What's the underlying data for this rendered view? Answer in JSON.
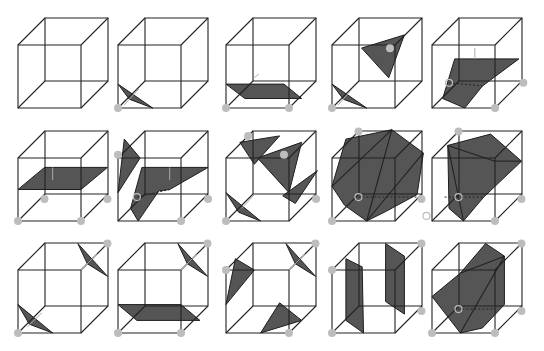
{
  "colors": {
    "edge": "#222222",
    "surface": "#555555",
    "vertex": "#bdbdbd",
    "normal": "#aaaaaa",
    "background": "#ffffff"
  },
  "layout": {
    "dx": 27,
    "dy": -27,
    "size": 63
  },
  "cubes": [
    {
      "id": 0,
      "x": 18,
      "y": 45,
      "vertices": [],
      "tris": []
    },
    {
      "id": 1,
      "x": 118,
      "y": 45,
      "vertices": [
        [
          0,
          1
        ]
      ],
      "tris": [
        [
          [
            0,
            0.62
          ],
          [
            0.55,
            1
          ],
          [
            0.18,
            0.86
          ]
        ]
      ],
      "arrows": [
        [
          [
            0.1,
            0.95
          ],
          [
            0.33,
            0.7
          ]
        ]
      ]
    },
    {
      "id": 2,
      "x": 226,
      "y": 45,
      "vertices": [
        [
          0,
          1
        ],
        [
          1,
          1
        ]
      ],
      "tris": [
        [
          [
            0,
            0.62
          ],
          [
            0.92,
            0.62
          ],
          [
            1.2,
            0.85
          ],
          [
            0.3,
            0.85
          ]
        ]
      ],
      "arrows": [
        [
          [
            0.45,
            0.52
          ],
          [
            0.52,
            0.46
          ]
        ]
      ]
    },
    {
      "id": 3,
      "x": 332,
      "y": 45,
      "vertices": [
        [
          0,
          1
        ],
        [
          0.92,
          0.05
        ]
      ],
      "tris": [
        [
          [
            0,
            0.62
          ],
          [
            0.55,
            1
          ],
          [
            0.18,
            0.86
          ]
        ],
        [
          [
            0.47,
            0.05
          ],
          [
            1.15,
            -0.16
          ],
          [
            0.9,
            0.52
          ]
        ]
      ],
      "arrows": [
        [
          [
            0.1,
            0.95
          ],
          [
            0.3,
            0.72
          ]
        ]
      ]
    },
    {
      "id": 4,
      "x": 432,
      "y": 45,
      "vertices": [
        [
          1,
          1
        ],
        [
          1.45,
          0.6
        ]
      ],
      "tris": [
        [
          [
            0.36,
            0.22
          ],
          [
            1.38,
            0.22
          ],
          [
            0.8,
            0.65
          ],
          [
            0.52,
            1.0
          ],
          [
            0.17,
            0.85
          ]
        ]
      ],
      "hidden": [
        [
          [
            0.27,
            0.6
          ],
          [
            0.8,
            0.65
          ]
        ]
      ],
      "open": [
        [
          0.27,
          0.6
        ]
      ],
      "arrows": [
        [
          [
            0.68,
            0.22
          ],
          [
            0.68,
            0.05
          ]
        ]
      ]
    },
    {
      "id": 5,
      "x": 18,
      "y": 158,
      "vertices": [
        [
          0,
          1
        ],
        [
          1,
          1
        ],
        [
          0.42,
          0.65
        ],
        [
          1.42,
          0.65
        ]
      ],
      "tris": [
        [
          [
            0,
            0.5
          ],
          [
            1,
            0.5
          ],
          [
            1.42,
            0.15
          ],
          [
            0.42,
            0.15
          ]
        ]
      ],
      "arrows": [
        [
          [
            0.55,
            0.35
          ],
          [
            0.55,
            0.15
          ]
        ]
      ]
    },
    {
      "id": 6,
      "x": 118,
      "y": 158,
      "vertices": [
        [
          1,
          1
        ],
        [
          0,
          -0.05
        ],
        [
          1.43,
          0.65
        ]
      ],
      "tris": [
        [
          [
            0.1,
            -0.3
          ],
          [
            0.35,
            0.0
          ],
          [
            0,
            0.55
          ]
        ],
        [
          [
            0.38,
            0.15
          ],
          [
            1.43,
            0.15
          ],
          [
            0.82,
            0.5
          ],
          [
            0.65,
            0.52
          ],
          [
            0.32,
            1.0
          ],
          [
            0.2,
            0.8
          ]
        ]
      ],
      "hidden": [
        [
          [
            0.3,
            0.62
          ],
          [
            0.82,
            0.5
          ]
        ]
      ],
      "open": [
        [
          0.3,
          0.62
        ]
      ],
      "arrows": [
        [
          [
            0.82,
            0.35
          ],
          [
            0.82,
            0.15
          ]
        ]
      ]
    },
    {
      "id": 7,
      "x": 226,
      "y": 158,
      "vertices": [
        [
          0,
          1
        ],
        [
          0.35,
          -0.35
        ],
        [
          1.43,
          0.65
        ],
        [
          0.92,
          -0.05
        ]
      ],
      "tris": [
        [
          [
            0.22,
            -0.25
          ],
          [
            0.85,
            -0.35
          ],
          [
            0.45,
            0.1
          ]
        ],
        [
          [
            0.5,
            0
          ],
          [
            1.2,
            -0.25
          ],
          [
            1,
            0.55
          ]
        ],
        [
          [
            0.9,
            0.6
          ],
          [
            1.45,
            0.2
          ],
          [
            1.1,
            0.72
          ]
        ],
        [
          [
            0,
            0.55
          ],
          [
            0.55,
            1
          ],
          [
            0.2,
            0.86
          ]
        ]
      ],
      "arrows": [
        [
          [
            0.25,
            0.8
          ],
          [
            0.45,
            0.58
          ]
        ]
      ]
    },
    {
      "id": 8,
      "x": 332,
      "y": 158,
      "vertices": [
        [
          0,
          1
        ],
        [
          1.42,
          0.65
        ],
        [
          0.42,
          -0.42
        ]
      ],
      "tris": [
        [
          [
            0.22,
            -0.3
          ],
          [
            0.95,
            -0.45
          ],
          [
            1.45,
            -0.08
          ],
          [
            1.35,
            0.58
          ],
          [
            0.85,
            0.85
          ],
          [
            0.55,
            1.0
          ],
          [
            0.2,
            0.75
          ],
          [
            0,
            0.45
          ]
        ]
      ],
      "hidden": [
        [
          [
            0.42,
            0.62
          ],
          [
            1.38,
            0.62
          ]
        ]
      ],
      "open": [
        [
          0.42,
          0.62
        ],
        [
          1.5,
          0.92
        ]
      ],
      "diagonals": [
        [
          [
            0.95,
            -0.45
          ],
          [
            0,
            0.45
          ]
        ],
        [
          [
            0.95,
            -0.45
          ],
          [
            0.55,
            1.0
          ]
        ],
        [
          [
            1.45,
            -0.08
          ],
          [
            0.55,
            1.0
          ]
        ]
      ]
    },
    {
      "id": 9,
      "x": 432,
      "y": 158,
      "vertices": [
        [
          0.42,
          -0.42
        ],
        [
          1.42,
          0.65
        ],
        [
          1,
          1
        ]
      ],
      "tris": [
        [
          [
            0.25,
            -0.2
          ],
          [
            0.93,
            -0.38
          ],
          [
            1.42,
            0.05
          ],
          [
            0.82,
            0.62
          ],
          [
            0.5,
            1.0
          ],
          [
            0.27,
            0.8
          ]
        ]
      ],
      "hidden": [
        [
          [
            0.2,
            0.62
          ],
          [
            0.82,
            0.62
          ]
        ]
      ],
      "open": [
        [
          0.42,
          0.62
        ]
      ],
      "diagonals": [
        [
          [
            0.25,
            -0.2
          ],
          [
            0.5,
            1.0
          ]
        ],
        [
          [
            0.25,
            -0.2
          ],
          [
            1.0,
            0.05
          ]
        ],
        [
          [
            1.0,
            0.05
          ],
          [
            1.42,
            0.05
          ]
        ]
      ]
    },
    {
      "id": 10,
      "x": 18,
      "y": 270,
      "vertices": [
        [
          0,
          1
        ],
        [
          1.42,
          -0.42
        ]
      ],
      "tris": [
        [
          [
            0,
            0.55
          ],
          [
            0.55,
            1
          ],
          [
            0.18,
            0.86
          ]
        ],
        [
          [
            0.95,
            -0.42
          ],
          [
            1.42,
            0.1
          ],
          [
            1.1,
            -0.1
          ]
        ]
      ],
      "arrows": [
        [
          [
            0.15,
            0.9
          ],
          [
            0.38,
            0.68
          ]
        ],
        [
          [
            1.25,
            -0.25
          ],
          [
            1.0,
            0.0
          ]
        ]
      ]
    },
    {
      "id": 11,
      "x": 118,
      "y": 270,
      "vertices": [
        [
          0,
          1
        ],
        [
          1,
          1
        ],
        [
          1.42,
          -0.42
        ]
      ],
      "tris": [
        [
          [
            0,
            0.55
          ],
          [
            1,
            0.55
          ],
          [
            1.3,
            0.8
          ],
          [
            0.3,
            0.8
          ]
        ],
        [
          [
            0.95,
            -0.42
          ],
          [
            1.42,
            0.1
          ],
          [
            1.1,
            -0.1
          ]
        ]
      ],
      "arrows": [
        [
          [
            1.25,
            -0.25
          ],
          [
            1.0,
            0.0
          ]
        ]
      ]
    },
    {
      "id": 12,
      "x": 226,
      "y": 270,
      "vertices": [
        [
          0,
          0
        ],
        [
          1.42,
          -0.42
        ],
        [
          1,
          1
        ]
      ],
      "tris": [
        [
          [
            0.15,
            -0.18
          ],
          [
            0.45,
            0
          ],
          [
            0,
            0.55
          ]
        ],
        [
          [
            0.95,
            -0.42
          ],
          [
            1.42,
            0.1
          ],
          [
            1.1,
            -0.1
          ]
        ],
        [
          [
            0.55,
            1
          ],
          [
            1.2,
            0.8
          ],
          [
            0.85,
            0.52
          ]
        ]
      ],
      "arrows": [
        [
          [
            1.25,
            -0.25
          ],
          [
            1.0,
            0.0
          ]
        ]
      ]
    },
    {
      "id": 13,
      "x": 332,
      "y": 270,
      "vertices": [
        [
          0,
          1
        ],
        [
          1.42,
          0.65
        ],
        [
          1.42,
          -0.42
        ],
        [
          0,
          0
        ]
      ],
      "tris": [
        [
          [
            0.22,
            -0.18
          ],
          [
            0.48,
            -0.05
          ],
          [
            0.5,
            1
          ],
          [
            0.22,
            0.8
          ]
        ],
        [
          [
            0.85,
            -0.42
          ],
          [
            1.15,
            -0.22
          ],
          [
            1.15,
            0.7
          ],
          [
            0.85,
            0.5
          ]
        ]
      ]
    },
    {
      "id": 14,
      "x": 432,
      "y": 270,
      "vertices": [
        [
          0,
          1
        ],
        [
          1,
          1
        ],
        [
          1.42,
          0.65
        ],
        [
          1.42,
          -0.42
        ]
      ],
      "tris": [
        [
          [
            0.85,
            -0.42
          ],
          [
            1.15,
            -0.22
          ],
          [
            1.15,
            0.55
          ],
          [
            0.8,
            0.92
          ],
          [
            0.45,
            1
          ],
          [
            0,
            0.42
          ],
          [
            0.45,
            0.05
          ]
        ]
      ],
      "hidden": [
        [
          [
            0.42,
            0.62
          ],
          [
            1.0,
            0.62
          ]
        ]
      ],
      "open": [
        [
          0.42,
          0.62
        ]
      ],
      "diagonals": [
        [
          [
            1.15,
            -0.22
          ],
          [
            0.45,
            1
          ]
        ],
        [
          [
            1.15,
            -0.22
          ],
          [
            0.45,
            0.05
          ]
        ]
      ]
    }
  ]
}
